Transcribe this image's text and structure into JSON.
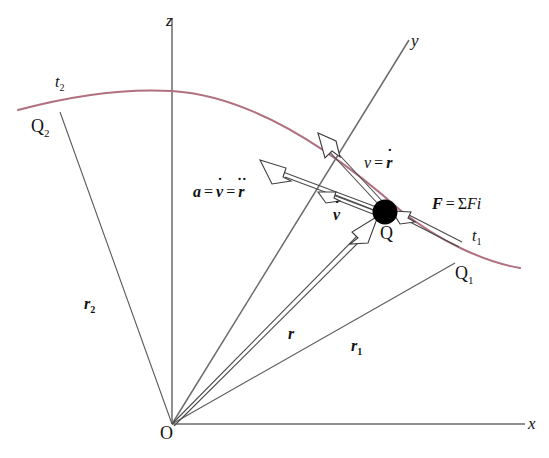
{
  "figure": {
    "background_color": "#ffffff",
    "trajectory_color": "#b0707f",
    "axis_color": "#6b6b6b",
    "ray_color": "#5a5a5a",
    "particle_color": "#000000"
  },
  "axes": {
    "z_label": "z",
    "y_label": "y",
    "x_label": "x",
    "origin_label": "O"
  },
  "points": {
    "q2_label": "Q",
    "q2_sub": "2",
    "q_label": "Q",
    "q1_label": "Q",
    "q1_sub": "1"
  },
  "times": {
    "t2_label": "t",
    "t2_sub": "2",
    "t1_label": "t",
    "t1_sub": "1"
  },
  "vectors": {
    "r2_label": "r",
    "r2_sub": "2",
    "r_label": "r",
    "r1_label": "r",
    "r1_sub": "1",
    "vdot_label": "v",
    "vdot_dots": "˙"
  },
  "equations": {
    "velocity": {
      "lhs": "v",
      "eq": "=",
      "rhs_base": "r",
      "rhs_dots": "˙"
    },
    "acceleration": {
      "lhs": "a",
      "eq1": "=",
      "mid_base": "v",
      "mid_dots": "˙",
      "eq2": "=",
      "rhs_base": "r",
      "rhs_dots": "˙˙"
    },
    "force": {
      "lhs": "F",
      "eq": "=",
      "sigma": "Σ",
      "rhs": "F",
      "index": "i"
    }
  }
}
